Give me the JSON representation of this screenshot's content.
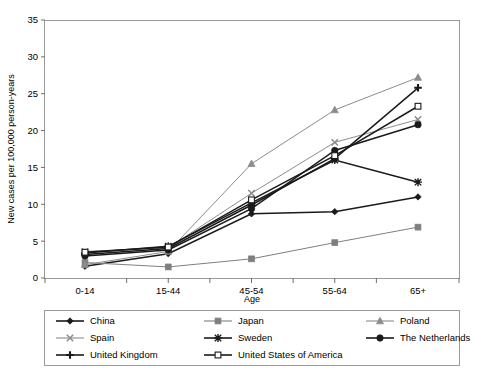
{
  "chart_data": {
    "type": "line",
    "title": "",
    "xlabel": "Age",
    "ylabel": "New cases per 100,000 person-years",
    "categories": [
      "0-14",
      "15-44",
      "45-54",
      "55-64",
      "65+"
    ],
    "ylim": [
      0,
      35
    ],
    "yticks": [
      0,
      5,
      10,
      15,
      20,
      25,
      30,
      35
    ],
    "grid": false,
    "legend_position": "bottom",
    "series": [
      {
        "name": "China",
        "marker": "diamond",
        "color": "#1a1a1a",
        "values": [
          1.6,
          3.3,
          8.7,
          9.0,
          11.0
        ]
      },
      {
        "name": "Japan",
        "marker": "square-filled",
        "color": "#7f7f7f",
        "values": [
          2.1,
          1.5,
          2.6,
          4.8,
          6.9
        ]
      },
      {
        "name": "Poland",
        "marker": "triangle",
        "color": "#8c8c8c",
        "values": [
          1.8,
          3.6,
          15.5,
          22.8,
          27.2
        ]
      },
      {
        "name": "Spain",
        "marker": "x",
        "color": "#8c8c8c",
        "values": [
          3.6,
          4.1,
          11.5,
          18.4,
          21.5
        ]
      },
      {
        "name": "Sweden",
        "marker": "asterisk",
        "color": "#1a1a1a",
        "values": [
          3.4,
          4.3,
          10.2,
          16.0,
          13.0
        ]
      },
      {
        "name": "The Netherlands",
        "marker": "circle",
        "color": "#1a1a1a",
        "values": [
          3.0,
          3.8,
          9.4,
          17.3,
          20.8
        ]
      },
      {
        "name": "United Kingdom",
        "marker": "plus",
        "color": "#1a1a1a",
        "values": [
          3.2,
          4.0,
          9.9,
          16.2,
          25.8
        ]
      },
      {
        "name": "United States of America",
        "marker": "square-open",
        "color": "#1a1a1a",
        "values": [
          3.5,
          4.2,
          10.6,
          16.6,
          23.3
        ]
      }
    ]
  },
  "legend": {
    "items": [
      {
        "label": "China"
      },
      {
        "label": "Japan"
      },
      {
        "label": "Poland"
      },
      {
        "label": "Spain"
      },
      {
        "label": "Sweden"
      },
      {
        "label": "The Netherlands"
      },
      {
        "label": "United Kingdom"
      },
      {
        "label": "United States of America"
      }
    ]
  },
  "colors": {
    "frame": "#9a9a9a",
    "dark": "#1a1a1a",
    "gray": "#8c8c8c",
    "japan_gray": "#7f7f7f"
  }
}
